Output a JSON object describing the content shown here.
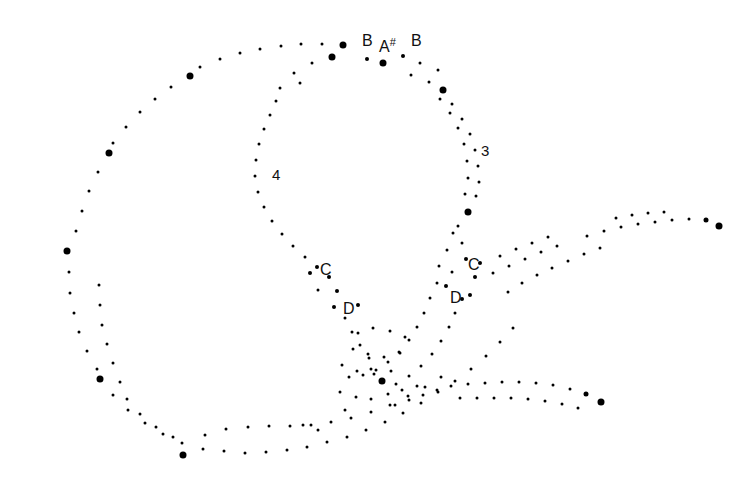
{
  "figure": {
    "width": 752,
    "height": 495,
    "background_color": "#ffffff",
    "dot_color": "#000000"
  },
  "labels": {
    "notes": [
      {
        "id": "b-upper-left",
        "text": "B",
        "sharp": "",
        "x": 362,
        "y": 33
      },
      {
        "id": "a-sharp-upper",
        "text": "A",
        "sharp": "#",
        "x": 379,
        "y": 37
      },
      {
        "id": "b-upper-right",
        "text": "B",
        "sharp": "",
        "x": 411,
        "y": 33
      },
      {
        "id": "c-left",
        "text": "C",
        "sharp": "",
        "x": 320,
        "y": 262
      },
      {
        "id": "d-left",
        "text": "D",
        "sharp": "",
        "x": 343,
        "y": 301
      },
      {
        "id": "c-right",
        "text": "C",
        "sharp": "",
        "x": 468,
        "y": 257
      },
      {
        "id": "d-right",
        "text": "D",
        "sharp": "",
        "x": 450,
        "y": 290
      }
    ],
    "octaves": [
      {
        "id": "octave-4",
        "text": "4",
        "x": 272,
        "y": 167
      },
      {
        "id": "octave-3",
        "text": "3",
        "x": 481,
        "y": 143
      }
    ]
  },
  "chart_data": {
    "type": "scatter",
    "title": "",
    "subtitle": "",
    "xlabel": "",
    "ylabel": "",
    "xlim": [
      0,
      752
    ],
    "ylim": [
      0,
      495
    ],
    "grid": false,
    "legend": null,
    "axes_visible": false,
    "marker_shape": "circle",
    "marker_color": "#000000",
    "marker_sizes": {
      "small": 3.0,
      "medium": 4.2,
      "large": 7.0
    },
    "annotations": [
      {
        "text": "B",
        "x": 362,
        "y": 33
      },
      {
        "text": "A#",
        "x": 379,
        "y": 37
      },
      {
        "text": "B",
        "x": 411,
        "y": 33
      },
      {
        "text": "4",
        "x": 272,
        "y": 167
      },
      {
        "text": "3",
        "x": 481,
        "y": 143
      },
      {
        "text": "C",
        "x": 320,
        "y": 262
      },
      {
        "text": "D",
        "x": 343,
        "y": 301
      },
      {
        "text": "C",
        "x": 468,
        "y": 257
      },
      {
        "text": "D",
        "x": 450,
        "y": 290
      }
    ],
    "series": [
      {
        "name": "outer-loop",
        "points": [
          [
            343,
            45,
            7
          ],
          [
            322,
            44,
            3
          ],
          [
            301,
            44,
            3
          ],
          [
            281,
            46,
            3
          ],
          [
            260,
            49,
            3
          ],
          [
            240,
            53,
            3
          ],
          [
            220,
            59,
            3
          ],
          [
            200,
            67,
            3
          ],
          [
            190,
            76,
            7
          ],
          [
            171,
            87,
            3
          ],
          [
            155,
            99,
            3
          ],
          [
            140,
            112,
            3
          ],
          [
            126,
            127,
            3
          ],
          [
            113,
            143,
            3
          ],
          [
            109,
            153,
            7
          ],
          [
            98,
            172,
            3
          ],
          [
            89,
            191,
            3
          ],
          [
            82,
            211,
            3
          ],
          [
            76,
            231,
            3
          ],
          [
            67,
            251,
            7
          ],
          [
            69,
            272,
            3
          ],
          [
            70,
            293,
            3
          ],
          [
            74,
            313,
            3
          ],
          [
            79,
            332,
            3
          ],
          [
            87,
            351,
            3
          ],
          [
            97,
            369,
            3
          ],
          [
            100,
            379,
            7
          ],
          [
            113,
            395,
            3
          ],
          [
            128,
            410,
            3
          ],
          [
            145,
            423,
            3
          ],
          [
            163,
            434,
            3
          ],
          [
            182,
            443,
            3
          ],
          [
            183,
            455,
            7
          ],
          [
            203,
            449,
            3
          ],
          [
            224,
            451,
            3
          ],
          [
            245,
            453,
            3
          ],
          [
            266,
            452,
            3
          ],
          [
            287,
            450,
            3
          ],
          [
            307,
            447,
            3
          ],
          [
            327,
            442,
            3
          ],
          [
            347,
            437,
            3
          ],
          [
            366,
            430,
            3
          ],
          [
            385,
            422,
            3
          ],
          [
            403,
            413,
            3
          ],
          [
            421,
            403,
            3
          ],
          [
            438,
            392,
            3
          ],
          [
            455,
            381,
            3
          ],
          [
            471,
            369,
            3
          ],
          [
            486,
            356,
            3
          ],
          [
            500,
            342,
            3
          ],
          [
            513,
            328,
            3
          ]
        ]
      },
      {
        "name": "outer-loop-inner-band",
        "points": [
          [
            205,
            435,
            3
          ],
          [
            226,
            429,
            3
          ],
          [
            248,
            427,
            3
          ],
          [
            269,
            426,
            3
          ],
          [
            290,
            426,
            3
          ],
          [
            311,
            425,
            3
          ],
          [
            331,
            422,
            3
          ],
          [
            351,
            418,
            3
          ],
          [
            371,
            412,
            3
          ],
          [
            390,
            405,
            3
          ],
          [
            408,
            396,
            3
          ],
          [
            425,
            387,
            3
          ],
          [
            441,
            377,
            3
          ],
          [
            120,
            382,
            3
          ],
          [
            127,
            399,
            3
          ],
          [
            140,
            414,
            3
          ],
          [
            156,
            427,
            3
          ],
          [
            173,
            437,
            3
          ],
          [
            113,
            363,
            3
          ],
          [
            107,
            344,
            3
          ],
          [
            102,
            325,
            3
          ],
          [
            100,
            305,
            3
          ],
          [
            99,
            285,
            3
          ]
        ]
      },
      {
        "name": "inner-loop-left-arc",
        "points": [
          [
            332,
            57,
            7
          ],
          [
            312,
            63,
            3
          ],
          [
            294,
            73,
            3
          ],
          [
            300,
            83,
            3
          ],
          [
            280,
            88,
            3
          ],
          [
            276,
            101,
            3
          ],
          [
            270,
            115,
            3
          ],
          [
            264,
            129,
            3
          ],
          [
            259,
            144,
            3
          ],
          [
            256,
            160,
            3
          ],
          [
            255,
            176,
            3
          ],
          [
            258,
            192,
            3
          ],
          [
            264,
            207,
            3
          ],
          [
            272,
            221,
            3
          ],
          [
            282,
            234,
            3
          ],
          [
            293,
            246,
            3
          ],
          [
            305,
            257,
            3
          ],
          [
            317,
            267,
            4
          ],
          [
            310,
            273,
            4
          ],
          [
            329,
            277,
            4
          ],
          [
            318,
            290,
            3
          ],
          [
            337,
            291,
            4
          ],
          [
            334,
            307,
            4
          ],
          [
            358,
            305,
            4
          ],
          [
            345,
            318,
            3
          ],
          [
            352,
            332,
            3
          ],
          [
            360,
            345,
            3
          ],
          [
            369,
            358,
            3
          ],
          [
            382,
            381,
            7
          ],
          [
            371,
            369,
            3
          ]
        ]
      },
      {
        "name": "inner-loop-right-arc",
        "points": [
          [
            403,
            56,
            4
          ],
          [
            383,
            63,
            7
          ],
          [
            367,
            59,
            4
          ],
          [
            420,
            63,
            3
          ],
          [
            438,
            70,
            3
          ],
          [
            443,
            90,
            7
          ],
          [
            452,
            104,
            3
          ],
          [
            462,
            119,
            3
          ],
          [
            470,
            134,
            3
          ],
          [
            475,
            150,
            3
          ],
          [
            478,
            166,
            3
          ],
          [
            479,
            182,
            3
          ],
          [
            468,
            212,
            7
          ],
          [
            476,
            196,
            3
          ],
          [
            458,
            226,
            3
          ],
          [
            462,
            243,
            3
          ],
          [
            466,
            259,
            4
          ],
          [
            480,
            263,
            4
          ],
          [
            452,
            272,
            3
          ],
          [
            475,
            277,
            4
          ],
          [
            446,
            286,
            4
          ],
          [
            470,
            295,
            4
          ],
          [
            462,
            299,
            4
          ],
          [
            455,
            313,
            3
          ],
          [
            449,
            327,
            3
          ],
          [
            441,
            341,
            3
          ],
          [
            432,
            354,
            3
          ],
          [
            421,
            366,
            3
          ],
          [
            409,
            376,
            3
          ],
          [
            396,
            384,
            3
          ]
        ]
      },
      {
        "name": "inner-loop-secondary-band",
        "points": [
          [
            411,
            75,
            3
          ],
          [
            429,
            82,
            3
          ],
          [
            440,
            99,
            3
          ],
          [
            450,
            113,
            3
          ],
          [
            458,
            128,
            3
          ],
          [
            464,
            144,
            3
          ],
          [
            467,
            161,
            3
          ],
          [
            468,
            178,
            3
          ],
          [
            465,
            194,
            3
          ],
          [
            453,
            233,
            3
          ],
          [
            447,
            250,
            3
          ],
          [
            439,
            266,
            3
          ],
          [
            437,
            283,
            3
          ],
          [
            430,
            298,
            3
          ],
          [
            424,
            313,
            3
          ],
          [
            417,
            327,
            3
          ],
          [
            409,
            340,
            3
          ],
          [
            399,
            352,
            3
          ],
          [
            388,
            362,
            3
          ],
          [
            376,
            370,
            3
          ],
          [
            363,
            375,
            3
          ],
          [
            349,
            377,
            3
          ]
        ]
      },
      {
        "name": "upper-right-tail",
        "points": [
          [
            508,
            292,
            3
          ],
          [
            522,
            283,
            3
          ],
          [
            537,
            275,
            3
          ],
          [
            552,
            268,
            3
          ],
          [
            568,
            261,
            3
          ],
          [
            584,
            254,
            3
          ],
          [
            600,
            248,
            3
          ],
          [
            587,
            236,
            3
          ],
          [
            604,
            231,
            3
          ],
          [
            621,
            227,
            3
          ],
          [
            638,
            224,
            3
          ],
          [
            655,
            222,
            3
          ],
          [
            672,
            220,
            3
          ],
          [
            689,
            219,
            3
          ],
          [
            706,
            220,
            5
          ],
          [
            719,
            226,
            7
          ],
          [
            616,
            218,
            3
          ],
          [
            632,
            215,
            3
          ],
          [
            648,
            213,
            3
          ],
          [
            664,
            212,
            3
          ],
          [
            557,
            246,
            3
          ],
          [
            541,
            252,
            3
          ],
          [
            525,
            259,
            3
          ],
          [
            509,
            266,
            3
          ],
          [
            493,
            273,
            3
          ],
          [
            500,
            256,
            3
          ],
          [
            516,
            249,
            3
          ],
          [
            532,
            243,
            3
          ],
          [
            548,
            237,
            3
          ]
        ]
      },
      {
        "name": "lower-right-tail",
        "points": [
          [
            451,
            386,
            3
          ],
          [
            468,
            384,
            3
          ],
          [
            485,
            383,
            3
          ],
          [
            502,
            382,
            3
          ],
          [
            519,
            382,
            3
          ],
          [
            536,
            383,
            3
          ],
          [
            553,
            385,
            3
          ],
          [
            570,
            389,
            3
          ],
          [
            586,
            394,
            5
          ],
          [
            601,
            402,
            7
          ],
          [
            460,
            398,
            3
          ],
          [
            477,
            398,
            3
          ],
          [
            494,
            398,
            3
          ],
          [
            511,
            398,
            3
          ],
          [
            528,
            399,
            3
          ],
          [
            545,
            401,
            3
          ],
          [
            562,
            404,
            3
          ],
          [
            578,
            408,
            3
          ],
          [
            437,
            390,
            3
          ],
          [
            423,
            395,
            3
          ],
          [
            409,
            400,
            3
          ],
          [
            395,
            405,
            3
          ],
          [
            417,
            386,
            3
          ],
          [
            402,
            390,
            3
          ],
          [
            388,
            394,
            3
          ]
        ]
      },
      {
        "name": "crossing-scatter",
        "points": [
          [
            358,
            333,
            3
          ],
          [
            373,
            328,
            3
          ],
          [
            390,
            331,
            3
          ],
          [
            405,
            337,
            3
          ],
          [
            353,
            349,
            3
          ],
          [
            368,
            354,
            3
          ],
          [
            384,
            357,
            3
          ],
          [
            400,
            353,
            3
          ],
          [
            342,
            365,
            3
          ],
          [
            357,
            371,
            3
          ],
          [
            374,
            374,
            3
          ],
          [
            391,
            371,
            3
          ],
          [
            340,
            392,
            3
          ],
          [
            356,
            397,
            3
          ],
          [
            371,
            399,
            3
          ],
          [
            345,
            410,
            3
          ],
          [
            303,
            425,
            3
          ],
          [
            318,
            430,
            3
          ]
        ]
      }
    ]
  }
}
